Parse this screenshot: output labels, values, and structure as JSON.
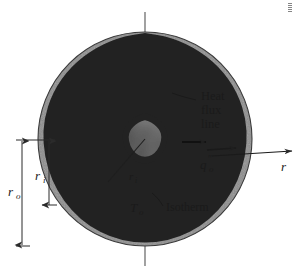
{
  "figure": {
    "labels": {
      "heat_flux_line": [
        "Heat",
        "flux",
        "line"
      ],
      "isotherm": "Isotherm",
      "outer_radius": "r",
      "outer_radius_sub": "o",
      "inner_radius": "r",
      "inner_radius_sub": "i",
      "inner_radius_center": "r",
      "inner_radius_center_sub": "i",
      "surface_temperature": "T",
      "surface_temperature_sub": "o",
      "heat_flux": "q",
      "heat_flux_prime": "″",
      "heat_flux_sub": "o",
      "radial_axis": "r"
    },
    "colors": {
      "background": "#ffffff",
      "outer_medium": "#8c8c8c",
      "inner_body": "#4a4a4a",
      "flux_band": "#b8b8b8",
      "grid_line": "#3d3d3d",
      "outline": "#2b2b2b",
      "text": "#1a1a1a",
      "axis_line": "#4d4d4d"
    },
    "geometry": {
      "center_x": 145,
      "center_y": 139,
      "outer_circle_radius": 107,
      "inner_shape_radius": 66,
      "flux_band_count": 5,
      "isotherm_arc_count": 6,
      "vertical_axis_top": 12,
      "vertical_axis_bottom": 266,
      "radial_arrow_x_start": 212,
      "radial_arrow_x_end": 292,
      "radial_arrow_y": 155,
      "dim_line_ro_x": 22,
      "dim_line_ri_x": 49,
      "dim_ro_top": 140,
      "dim_ro_bottom": 246,
      "dim_ri_top": 140,
      "dim_ri_bottom": 205
    }
  }
}
